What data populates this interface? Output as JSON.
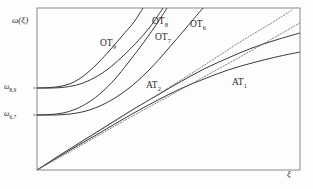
{
  "figure": {
    "background": "#fdfdfd",
    "frame_color": "#8a8a8a",
    "curve_color": "#3a3a3a",
    "dotted_color": "#6e6e6e"
  },
  "axes": {
    "ylabel": "ω(ξ)",
    "xlabel": "ξ",
    "yticks": [
      {
        "name": "omega-8-9",
        "base": "ω",
        "sub": "8,9",
        "y_px": 88
      },
      {
        "name": "omega-6-7",
        "base": "ω",
        "sub": "6,7",
        "y_px": 115
      }
    ],
    "frame": {
      "left": 37,
      "right": 300,
      "top": 8,
      "bottom": 170
    }
  },
  "annotations": [
    {
      "name": "label-ot9",
      "base": "OT",
      "sub": "9",
      "x": 100,
      "y": 39
    },
    {
      "name": "label-ot8",
      "base": "OT",
      "sub": "8",
      "x": 152,
      "y": 17
    },
    {
      "name": "label-ot7",
      "base": "OT",
      "sub": "7",
      "x": 155,
      "y": 33
    },
    {
      "name": "label-ot6",
      "base": "OT",
      "sub": "6",
      "x": 190,
      "y": 20
    },
    {
      "name": "label-at2",
      "base": "AT",
      "sub": "2",
      "x": 146,
      "y": 81
    },
    {
      "name": "label-at1",
      "base": "AT",
      "sub": "1",
      "x": 232,
      "y": 78
    }
  ],
  "chart_data": {
    "type": "line",
    "title": "",
    "xlabel": "ξ",
    "ylabel": "ω(ξ)",
    "xlim": [
      0,
      1
    ],
    "ylim": [
      0,
      1
    ],
    "grid": false,
    "legend": "inline-annotations",
    "tick_labels_y": [
      "ω6,7",
      "ω8,9"
    ],
    "tick_labels_x": [],
    "series": [
      {
        "name": "OT9",
        "style": "solid",
        "group": "optical",
        "cutoff": "ω8,9",
        "points": [
          [
            37,
            88
          ],
          [
            50,
            87.5
          ],
          [
            62,
            86
          ],
          [
            74,
            82
          ],
          [
            86,
            74
          ],
          [
            98,
            63
          ],
          [
            110,
            50
          ],
          [
            122,
            36
          ],
          [
            134,
            22
          ],
          [
            143,
            8
          ]
        ]
      },
      {
        "name": "OT8",
        "style": "solid",
        "group": "optical",
        "cutoff": "ω8,9",
        "points": [
          [
            37,
            88
          ],
          [
            52,
            88
          ],
          [
            66,
            87
          ],
          [
            80,
            84
          ],
          [
            94,
            78
          ],
          [
            108,
            69
          ],
          [
            122,
            57
          ],
          [
            136,
            43
          ],
          [
            150,
            27
          ],
          [
            163,
            8
          ]
        ]
      },
      {
        "name": "OT7",
        "style": "solid",
        "group": "optical",
        "cutoff": "ω6,7",
        "points": [
          [
            37,
            115
          ],
          [
            50,
            114.5
          ],
          [
            63,
            113
          ],
          [
            76,
            109
          ],
          [
            89,
            102
          ],
          [
            102,
            92
          ],
          [
            115,
            79
          ],
          [
            128,
            63
          ],
          [
            144,
            42
          ],
          [
            158,
            22
          ],
          [
            167,
            8
          ]
        ]
      },
      {
        "name": "OT6",
        "style": "solid",
        "group": "optical",
        "cutoff": "ω6,7",
        "points": [
          [
            37,
            115
          ],
          [
            54,
            115
          ],
          [
            70,
            114
          ],
          [
            86,
            111
          ],
          [
            102,
            105
          ],
          [
            118,
            96
          ],
          [
            134,
            84
          ],
          [
            150,
            69
          ],
          [
            168,
            49
          ],
          [
            186,
            28
          ],
          [
            203,
            8
          ]
        ]
      },
      {
        "name": "AT1",
        "style": "solid",
        "group": "acoustic",
        "points": [
          [
            37,
            170
          ],
          [
            60,
            156
          ],
          [
            84,
            142
          ],
          [
            108,
            128
          ],
          [
            132,
            114
          ],
          [
            156,
            101
          ],
          [
            180,
            89
          ],
          [
            204,
            79
          ],
          [
            228,
            70
          ],
          [
            252,
            63
          ],
          [
            276,
            57
          ],
          [
            300,
            52
          ]
        ]
      },
      {
        "name": "AT2",
        "style": "solid",
        "group": "acoustic",
        "points": [
          [
            37,
            170
          ],
          [
            60,
            155
          ],
          [
            84,
            140
          ],
          [
            108,
            125
          ],
          [
            132,
            110
          ],
          [
            156,
            96
          ],
          [
            180,
            82
          ],
          [
            204,
            69
          ],
          [
            228,
            58
          ],
          [
            252,
            48
          ],
          [
            276,
            40
          ],
          [
            300,
            33
          ]
        ]
      },
      {
        "name": "AT2-asymptote",
        "style": "dotted",
        "group": "asymptote",
        "points": [
          [
            37,
            170
          ],
          [
            80,
            143
          ],
          [
            120,
            118
          ],
          [
            160,
            93
          ],
          [
            200,
            68
          ],
          [
            240,
            42
          ],
          [
            270,
            24
          ],
          [
            292,
            10
          ]
        ]
      },
      {
        "name": "AT1-asymptote",
        "style": "dotted",
        "group": "asymptote",
        "points": [
          [
            37,
            170
          ],
          [
            80,
            146
          ],
          [
            120,
            123
          ],
          [
            160,
            101
          ],
          [
            200,
            79
          ],
          [
            240,
            57
          ],
          [
            270,
            40
          ],
          [
            300,
            23
          ]
        ]
      }
    ]
  }
}
